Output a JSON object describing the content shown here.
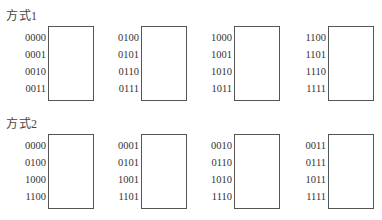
{
  "sections": [
    {
      "title": "方式1",
      "groups": [
        {
          "labels": [
            "0000",
            "0001",
            "0010",
            "0011"
          ]
        },
        {
          "labels": [
            "0100",
            "0101",
            "0110",
            "0111"
          ]
        },
        {
          "labels": [
            "1000",
            "1001",
            "1010",
            "1011"
          ]
        },
        {
          "labels": [
            "1100",
            "1101",
            "1110",
            "1111"
          ]
        }
      ]
    },
    {
      "title": "方式2",
      "groups": [
        {
          "labels": [
            "0000",
            "0100",
            "1000",
            "1100"
          ]
        },
        {
          "labels": [
            "0001",
            "0101",
            "1001",
            "1101"
          ]
        },
        {
          "labels": [
            "0010",
            "0110",
            "1010",
            "1110"
          ]
        },
        {
          "labels": [
            "0011",
            "0111",
            "1011",
            "1111"
          ]
        }
      ]
    }
  ]
}
